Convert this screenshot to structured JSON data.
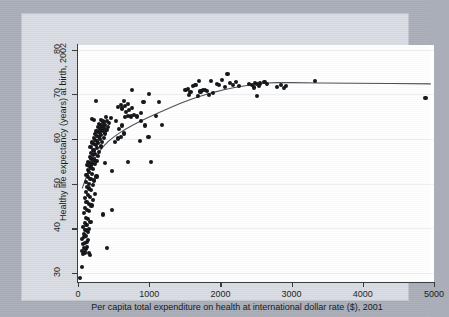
{
  "figure": {
    "background_color": "#a9aeb8",
    "graph_region_color": "#d9dce2",
    "plot_background_color": "#ffffff",
    "axis_color": "#35393f",
    "marker_color": "#111316",
    "fit_line_color": "#4a4f57",
    "gridline_color": "#eceef1"
  },
  "chart_data": {
    "type": "scatter",
    "title": "",
    "subtitle": "",
    "xlabel": "Per capita total expenditure on health at international dollar rate ($), 2001",
    "ylabel": "Healthy life expectancy (years) at birth, 2002",
    "xlim": [
      0,
      5000
    ],
    "ylim": [
      28,
      81
    ],
    "xticks": [
      0,
      1000,
      2000,
      3000,
      4000,
      5000
    ],
    "yticks": [
      30,
      40,
      50,
      60,
      70,
      80
    ],
    "xtick_labels": [
      "0",
      "1000",
      "2000",
      "3000",
      "4000",
      "5000"
    ],
    "ytick_labels": [
      "30",
      "40",
      "50",
      "60",
      "70",
      "80"
    ],
    "grid": "horizontal",
    "legend": null,
    "marker_shape": "circle",
    "marker_size_px": 4.2,
    "points": [
      [
        30,
        28.8
      ],
      [
        60,
        31.3
      ],
      [
        75,
        34.2
      ],
      [
        95,
        34.6
      ],
      [
        55,
        35.0
      ],
      [
        110,
        35.3
      ],
      [
        85,
        35.6
      ],
      [
        130,
        35.9
      ],
      [
        150,
        34.4
      ],
      [
        165,
        34.1
      ],
      [
        405,
        35.6
      ],
      [
        70,
        36.4
      ],
      [
        100,
        36.8
      ],
      [
        125,
        37.0
      ],
      [
        145,
        37.3
      ],
      [
        60,
        37.6
      ],
      [
        90,
        38.0
      ],
      [
        115,
        38.3
      ],
      [
        80,
        38.8
      ],
      [
        135,
        39.2
      ],
      [
        105,
        39.6
      ],
      [
        150,
        39.9
      ],
      [
        70,
        40.2
      ],
      [
        120,
        40.7
      ],
      [
        95,
        41.1
      ],
      [
        175,
        41.4
      ],
      [
        140,
        42.0
      ],
      [
        110,
        42.4
      ],
      [
        345,
        43.1
      ],
      [
        85,
        43.4
      ],
      [
        160,
        43.8
      ],
      [
        130,
        44.2
      ],
      [
        480,
        44.2
      ],
      [
        100,
        44.6
      ],
      [
        190,
        45.1
      ],
      [
        150,
        45.5
      ],
      [
        120,
        45.9
      ],
      [
        210,
        46.3
      ],
      [
        95,
        46.7
      ],
      [
        170,
        47.1
      ],
      [
        140,
        47.5
      ],
      [
        235,
        47.7
      ],
      [
        115,
        48.1
      ],
      [
        185,
        48.5
      ],
      [
        160,
        48.9
      ],
      [
        130,
        49.3
      ],
      [
        205,
        49.6
      ],
      [
        150,
        50.0
      ],
      [
        110,
        50.4
      ],
      [
        225,
        50.7
      ],
      [
        175,
        51.1
      ],
      [
        140,
        51.4
      ],
      [
        260,
        51.6
      ],
      [
        120,
        51.9
      ],
      [
        195,
        52.2
      ],
      [
        160,
        52.5
      ],
      [
        480,
        52.8
      ],
      [
        135,
        53.0
      ],
      [
        215,
        53.3
      ],
      [
        180,
        53.6
      ],
      [
        155,
        53.9
      ],
      [
        700,
        54.8
      ],
      [
        125,
        54.1
      ],
      [
        240,
        54.3
      ],
      [
        200,
        54.5
      ],
      [
        170,
        54.7
      ],
      [
        375,
        54.6
      ],
      [
        145,
        54.9
      ],
      [
        260,
        55.1
      ],
      [
        220,
        55.4
      ],
      [
        190,
        55.6
      ],
      [
        165,
        55.9
      ],
      [
        280,
        56.1
      ],
      [
        210,
        56.4
      ],
      [
        240,
        56.6
      ],
      [
        185,
        56.9
      ],
      [
        300,
        57.1
      ],
      [
        230,
        57.4
      ],
      [
        205,
        57.6
      ],
      [
        265,
        57.9
      ],
      [
        175,
        58.1
      ],
      [
        320,
        58.3
      ],
      [
        250,
        58.6
      ],
      [
        225,
        58.8
      ],
      [
        285,
        59.0
      ],
      [
        200,
        59.2
      ],
      [
        340,
        59.4
      ],
      [
        270,
        59.6
      ],
      [
        245,
        59.8
      ],
      [
        305,
        60.0
      ],
      [
        220,
        60.2
      ],
      [
        360,
        60.3
      ],
      [
        290,
        60.5
      ],
      [
        265,
        60.7
      ],
      [
        325,
        60.9
      ],
      [
        240,
        61.0
      ],
      [
        380,
        61.2
      ],
      [
        310,
        61.4
      ],
      [
        285,
        61.5
      ],
      [
        345,
        61.7
      ],
      [
        260,
        61.8
      ],
      [
        400,
        62.0
      ],
      [
        330,
        62.1
      ],
      [
        305,
        62.3
      ],
      [
        365,
        62.4
      ],
      [
        280,
        62.6
      ],
      [
        420,
        62.7
      ],
      [
        350,
        62.9
      ],
      [
        325,
        63.0
      ],
      [
        385,
        63.2
      ],
      [
        300,
        63.4
      ],
      [
        440,
        63.5
      ],
      [
        370,
        63.7
      ],
      [
        345,
        63.9
      ],
      [
        405,
        64.0
      ],
      [
        320,
        64.2
      ],
      [
        230,
        64.3
      ],
      [
        195,
        64.4
      ],
      [
        460,
        64.6
      ],
      [
        390,
        64.8
      ],
      [
        520,
        59.3
      ],
      [
        560,
        60.1
      ],
      [
        600,
        60.5
      ],
      [
        640,
        61.2
      ],
      [
        580,
        62.2
      ],
      [
        620,
        63.0
      ],
      [
        540,
        64.1
      ],
      [
        660,
        64.8
      ],
      [
        700,
        65.2
      ],
      [
        745,
        65.0
      ],
      [
        790,
        65.3
      ],
      [
        830,
        65.0
      ],
      [
        680,
        66.0
      ],
      [
        720,
        66.5
      ],
      [
        620,
        66.8
      ],
      [
        560,
        67.1
      ],
      [
        660,
        67.3
      ],
      [
        600,
        67.6
      ],
      [
        700,
        67.9
      ],
      [
        760,
        67.0
      ],
      [
        880,
        64.0
      ],
      [
        940,
        63.0
      ],
      [
        990,
        60.4
      ],
      [
        870,
        59.6
      ],
      [
        1020,
        54.9
      ],
      [
        760,
        70.9
      ],
      [
        640,
        68.5
      ],
      [
        1000,
        70.1
      ],
      [
        920,
        68.3
      ],
      [
        1140,
        68.3
      ],
      [
        1180,
        63.2
      ],
      [
        1090,
        65.1
      ],
      [
        890,
        65.7
      ],
      [
        250,
        68.4
      ],
      [
        1510,
        71.0
      ],
      [
        1540,
        71.2
      ],
      [
        1560,
        69.8
      ],
      [
        1580,
        70.4
      ],
      [
        1620,
        71.9
      ],
      [
        1650,
        72.0
      ],
      [
        1680,
        69.6
      ],
      [
        1700,
        73.0
      ],
      [
        1720,
        70.6
      ],
      [
        1760,
        70.9
      ],
      [
        1790,
        71.0
      ],
      [
        1810,
        70.8
      ],
      [
        1840,
        69.9
      ],
      [
        1870,
        72.9
      ],
      [
        1900,
        70.3
      ],
      [
        1950,
        72.3
      ],
      [
        1980,
        72.0
      ],
      [
        2020,
        73.2
      ],
      [
        2060,
        71.6
      ],
      [
        2100,
        74.6
      ],
      [
        2140,
        72.6
      ],
      [
        2180,
        72.0
      ],
      [
        2220,
        72.7
      ],
      [
        2260,
        71.8
      ],
      [
        2400,
        72.3
      ],
      [
        2440,
        72.0
      ],
      [
        2470,
        71.5
      ],
      [
        2490,
        72.6
      ],
      [
        2510,
        72.3
      ],
      [
        2520,
        69.6
      ],
      [
        2540,
        71.9
      ],
      [
        2560,
        72.4
      ],
      [
        2620,
        72.8
      ],
      [
        2660,
        72.2
      ],
      [
        2800,
        71.6
      ],
      [
        2850,
        72.1
      ],
      [
        2890,
        71.4
      ],
      [
        2920,
        71.8
      ],
      [
        3330,
        72.9
      ],
      [
        4880,
        69.2
      ]
    ],
    "fit_line": {
      "name": "lowess-fit",
      "points": [
        [
          60,
          49.0
        ],
        [
          120,
          51.6
        ],
        [
          180,
          53.8
        ],
        [
          240,
          55.6
        ],
        [
          300,
          57.2
        ],
        [
          360,
          58.4
        ],
        [
          430,
          59.5
        ],
        [
          500,
          60.4
        ],
        [
          580,
          61.3
        ],
        [
          660,
          62.1
        ],
        [
          760,
          63.0
        ],
        [
          880,
          64.0
        ],
        [
          1000,
          64.9
        ],
        [
          1140,
          65.9
        ],
        [
          1300,
          67.0
        ],
        [
          1450,
          68.0
        ],
        [
          1600,
          68.9
        ],
        [
          1750,
          69.7
        ],
        [
          1900,
          70.4
        ],
        [
          2050,
          71.0
        ],
        [
          2200,
          71.5
        ],
        [
          2350,
          71.9
        ],
        [
          2500,
          72.3
        ],
        [
          2650,
          72.5
        ],
        [
          2800,
          72.6
        ],
        [
          3000,
          72.6
        ],
        [
          3400,
          72.5
        ],
        [
          3900,
          72.45
        ],
        [
          4400,
          72.4
        ],
        [
          4950,
          72.3
        ]
      ]
    }
  }
}
